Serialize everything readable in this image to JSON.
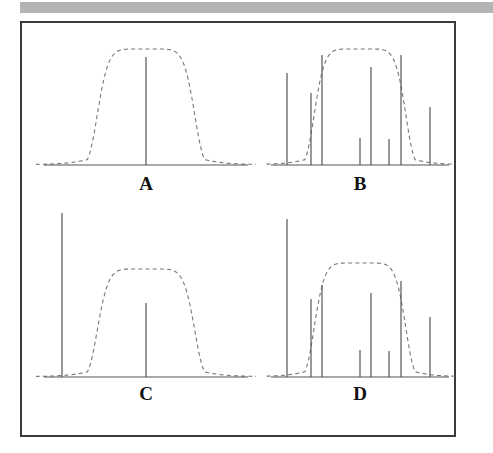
{
  "figure": {
    "top_band_color": "#b4b4b4",
    "frame_color": "#3a3a3a",
    "line_color": "#555555",
    "envelope_color": "#777777",
    "background": "#ffffff"
  },
  "panels": [
    {
      "id": "A",
      "label": "A",
      "description": "single central spectral line under flat-topped dashed envelope",
      "baseline_y": 132,
      "axis": {
        "x0": 8,
        "x1": 212
      },
      "envelope": {
        "type": "flat-top-bell",
        "center_x": 110,
        "half_width": 50,
        "top_y": 16,
        "shoulder_softness": 22
      },
      "lines": [
        {
          "x": 110,
          "height": 108
        }
      ]
    },
    {
      "id": "B",
      "label": "B",
      "description": "eight spectral lines of varying heights under flat-topped dashed envelope",
      "baseline_y": 132,
      "axis": {
        "x0": 6,
        "x1": 184
      },
      "envelope": {
        "type": "flat-top-bell",
        "center_x": 95,
        "half_width": 47,
        "top_y": 16,
        "shoulder_softness": 20
      },
      "lines": [
        {
          "x": 22,
          "height": 92
        },
        {
          "x": 46,
          "height": 72
        },
        {
          "x": 57,
          "height": 110
        },
        {
          "x": 95,
          "height": 27
        },
        {
          "x": 106,
          "height": 98
        },
        {
          "x": 124,
          "height": 26
        },
        {
          "x": 136,
          "height": 110
        },
        {
          "x": 165,
          "height": 58
        }
      ]
    },
    {
      "id": "C",
      "label": "C",
      "description": "one very tall off-resonance line at far left plus short central line under dashed envelope",
      "baseline_y": 172,
      "axis": {
        "x0": 8,
        "x1": 212
      },
      "envelope": {
        "type": "flat-top-bell",
        "center_x": 110,
        "half_width": 50,
        "top_y": 64,
        "shoulder_softness": 22
      },
      "lines": [
        {
          "x": 26,
          "height": 164
        },
        {
          "x": 110,
          "height": 74
        }
      ]
    },
    {
      "id": "D",
      "label": "D",
      "description": "eight spectral lines with very tall leftmost line exceeding the dashed envelope",
      "baseline_y": 172,
      "axis": {
        "x0": 6,
        "x1": 184
      },
      "envelope": {
        "type": "flat-top-bell",
        "center_x": 95,
        "half_width": 47,
        "top_y": 58,
        "shoulder_softness": 20
      },
      "lines": [
        {
          "x": 22,
          "height": 158
        },
        {
          "x": 46,
          "height": 78
        },
        {
          "x": 57,
          "height": 92
        },
        {
          "x": 95,
          "height": 27
        },
        {
          "x": 106,
          "height": 84
        },
        {
          "x": 124,
          "height": 26
        },
        {
          "x": 136,
          "height": 96
        },
        {
          "x": 165,
          "height": 60
        }
      ]
    }
  ]
}
